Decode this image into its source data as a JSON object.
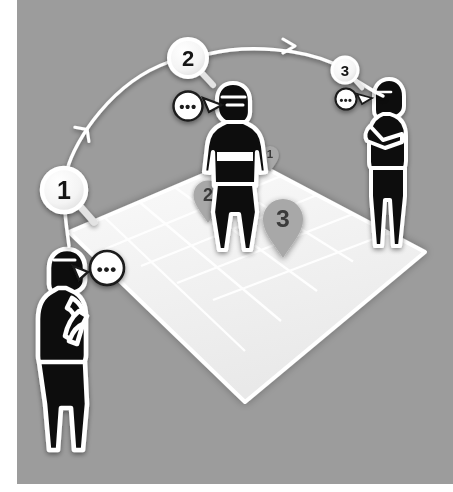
{
  "scene": {
    "title": "Wayfinding journey illustration",
    "background_color": "#9c9c9c",
    "margin_color": "#ffffff",
    "width": 453,
    "height": 492
  },
  "colors": {
    "background": "#9c9c9c",
    "figure_fill": "#111111",
    "figure_outline": "#ffffff",
    "plane_fill": "#f2f2f2",
    "plane_grid": "#ffffff",
    "pin_fill": "#a8a8a8",
    "pin_text": "#3a3a3a",
    "marker_fill": "#f4f4f4",
    "marker_text": "#1a1a1a",
    "path_stroke": "#ffffff",
    "bubble_fill": "#ffffff",
    "bubble_stroke": "#1a1a1a"
  },
  "journey_path": {
    "label": "curved-journey-arrow",
    "arrowheads": 2,
    "direction": "left-to-right"
  },
  "step_markers": [
    {
      "id": "step-1",
      "label": "1",
      "cx": 47,
      "cy": 190,
      "r": 22,
      "font_size": 24
    },
    {
      "id": "step-2",
      "label": "2",
      "cx": 171,
      "cy": 58,
      "r": 19,
      "font_size": 21
    },
    {
      "id": "step-3",
      "label": "3",
      "cx": 328,
      "cy": 70,
      "r": 13,
      "font_size": 14
    }
  ],
  "map_pins": [
    {
      "id": "pin-1",
      "label": "1",
      "x": 253,
      "y": 172,
      "scale": 0.52
    },
    {
      "id": "pin-2",
      "label": "2",
      "x": 191,
      "y": 223,
      "scale": 0.85
    },
    {
      "id": "pin-3",
      "label": "3",
      "x": 266,
      "y": 258,
      "scale": 1.18
    }
  ],
  "figures": [
    {
      "id": "figure-observer-left",
      "pose": "profile-thinking",
      "facing": "right",
      "bubble_text": "•••",
      "bubble_side": "right"
    },
    {
      "id": "figure-observer-center",
      "pose": "frontal-standing",
      "facing": "front",
      "bubble_text": "•••",
      "bubble_side": "left"
    },
    {
      "id": "figure-observer-right",
      "pose": "profile-arms-crossed",
      "facing": "left",
      "bubble_text": "•••",
      "bubble_side": "left"
    }
  ],
  "grid_plane": {
    "label": "isometric-grid-plane",
    "rows": 5,
    "cols": 5,
    "corner_left": [
      52,
      232
    ],
    "corner_top": [
      228,
      157
    ],
    "corner_right": [
      408,
      252
    ],
    "corner_bottom": [
      228,
      402
    ]
  }
}
